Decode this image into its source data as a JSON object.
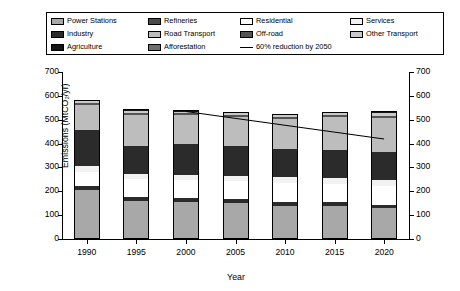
{
  "legend": {
    "rows": [
      [
        {
          "label": "Power Stations",
          "color": "#a8a8a8",
          "type": "swatch",
          "name": "power-stations"
        },
        {
          "label": "Refineries",
          "color": "#4a4a4a",
          "type": "swatch",
          "name": "refineries"
        },
        {
          "label": "Residential",
          "color": "#ffffff",
          "type": "swatch",
          "name": "residential"
        },
        {
          "label": "Services",
          "color": "#f2f2f2",
          "type": "swatch",
          "name": "services"
        }
      ],
      [
        {
          "label": "Industry",
          "color": "#2b2b2b",
          "type": "swatch",
          "name": "industry"
        },
        {
          "label": "Road Transport",
          "color": "#bdbdbd",
          "type": "swatch",
          "name": "road-transport"
        },
        {
          "label": "Off-road",
          "color": "#545454",
          "type": "swatch",
          "name": "off-road"
        },
        {
          "label": "Other Transport",
          "color": "#c9c9c9",
          "type": "swatch",
          "name": "other-transport"
        }
      ],
      [
        {
          "label": "Agriculture",
          "color": "#151515",
          "type": "swatch",
          "name": "agriculture"
        },
        {
          "label": "Afforestation",
          "color": "#6e6e6e",
          "type": "swatch",
          "name": "afforestation"
        },
        {
          "label": "60% reduction by 2050",
          "color": "#000000",
          "type": "line",
          "name": "reduction-target-line"
        },
        null
      ]
    ]
  },
  "chart_data": {
    "type": "bar",
    "stacked": true,
    "title": "",
    "xlabel": "Year",
    "ylabel": "Emissions (MtCO₂/yr)",
    "ylim": [
      0,
      700
    ],
    "yticks": [
      0,
      100,
      200,
      300,
      400,
      500,
      600,
      700
    ],
    "y2lim": [
      0,
      700
    ],
    "y2ticks": [
      0,
      100,
      200,
      300,
      400,
      500,
      600,
      700
    ],
    "grid": false,
    "legend_position": "top",
    "categories": [
      "1990",
      "1995",
      "2000",
      "2005",
      "2010",
      "2015",
      "2020"
    ],
    "series": [
      {
        "name": "Power Stations",
        "color": "#a8a8a8",
        "values": [
          205,
          160,
          155,
          150,
          140,
          140,
          128
        ]
      },
      {
        "name": "Industry",
        "color": "#2b2b2b",
        "values": [
          18,
          18,
          16,
          16,
          16,
          14,
          16
        ]
      },
      {
        "name": "Residential",
        "color": "#ffffff",
        "values": [
          60,
          72,
          76,
          76,
          78,
          78,
          80
        ]
      },
      {
        "name": "Services",
        "color": "#f2f2f2",
        "values": [
          22,
          22,
          22,
          24,
          24,
          24,
          24
        ]
      },
      {
        "name": "Refineries",
        "color": "#2b2b2b",
        "values": [
          150,
          120,
          130,
          122,
          120,
          118,
          118
        ]
      },
      {
        "name": "Road Transport",
        "color": "#bdbdbd",
        "values": [
          108,
          130,
          120,
          124,
          126,
          138,
          143
        ]
      },
      {
        "name": "Off-road",
        "color": "#545454",
        "values": [
          8,
          8,
          8,
          8,
          9,
          8,
          8
        ]
      },
      {
        "name": "Other Transport",
        "color": "#c9c9c9",
        "values": [
          6,
          8,
          6,
          7,
          6,
          7,
          10
        ]
      },
      {
        "name": "Agriculture",
        "color": "#151515",
        "values": [
          6,
          7,
          7,
          6,
          6,
          6,
          8
        ]
      }
    ],
    "totals": [
      583,
      545,
      540,
      533,
      525,
      533,
      535
    ],
    "trend_line": {
      "name": "60% reduction by 2050",
      "color": "#000000",
      "x": [
        "2000",
        "2020"
      ],
      "y": [
        535,
        420
      ]
    }
  }
}
